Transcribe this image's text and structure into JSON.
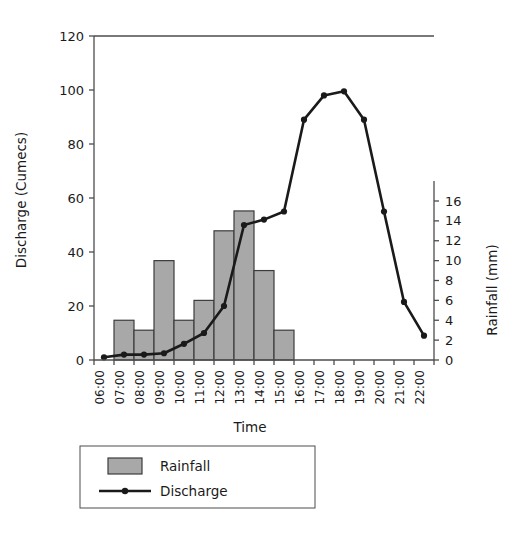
{
  "chart_data": {
    "type": "bar",
    "title": "",
    "subtitle": "",
    "xlabel": "Time",
    "ylabel": "Discharge (Cumecs)",
    "y2label": "Rainfall (mm)",
    "categories": [
      "06:00",
      "07:00",
      "08:00",
      "09:00",
      "10:00",
      "11:00",
      "12:00",
      "13:00",
      "14:00",
      "15:00",
      "16:00",
      "17:00",
      "18:00",
      "19:00",
      "20:00",
      "21:00",
      "22:00"
    ],
    "ylim": [
      0,
      120
    ],
    "yticks": [
      0,
      20,
      40,
      60,
      80,
      100,
      120
    ],
    "y2lim": [
      0,
      16
    ],
    "y2ticks": [
      0,
      2,
      4,
      6,
      8,
      10,
      12,
      14,
      16
    ],
    "grid": false,
    "legend_position": "bottom",
    "series": [
      {
        "name": "Rainfall",
        "type": "bar",
        "axis": "right",
        "unit": "mm",
        "color": "#a8a8a8",
        "edge_color": "#3c3c3c",
        "values": [
          0,
          4,
          3,
          10,
          4,
          6,
          13,
          15,
          9,
          3,
          0,
          0,
          0,
          0,
          0,
          0,
          0
        ]
      },
      {
        "name": "Discharge",
        "type": "line",
        "axis": "left",
        "unit": "Cumecs",
        "color": "#1a1a1a",
        "marker": "circle",
        "values": [
          1,
          2,
          2,
          2.5,
          6,
          10,
          20,
          50,
          52,
          55,
          89,
          98,
          99.5,
          89,
          55,
          21.5,
          9
        ]
      }
    ]
  },
  "legend": {
    "items": [
      {
        "label": "Rainfall",
        "kind": "swatch"
      },
      {
        "label": "Discharge",
        "kind": "line-marker"
      }
    ]
  },
  "axes": {
    "left": {
      "title": "Discharge (Cumecs)",
      "ticks": [
        "0",
        "20",
        "40",
        "60",
        "80",
        "100",
        "120"
      ]
    },
    "right": {
      "title": "Rainfall (mm)",
      "ticks": [
        "0",
        "2",
        "4",
        "6",
        "8",
        "10",
        "12",
        "14",
        "16"
      ]
    },
    "bottom": {
      "title": "Time",
      "ticks": [
        "06:00",
        "07:00",
        "08:00",
        "09:00",
        "10:00",
        "11:00",
        "12:00",
        "13:00",
        "14:00",
        "15:00",
        "16:00",
        "17:00",
        "18:00",
        "19:00",
        "20:00",
        "21:00",
        "22:00"
      ]
    }
  },
  "colors": {
    "bar_fill": "#a8a8a8",
    "bar_edge": "#3c3c3c",
    "line": "#1a1a1a",
    "axis": "#4d4d4d",
    "text": "#1a1a1a",
    "background": "#ffffff"
  }
}
